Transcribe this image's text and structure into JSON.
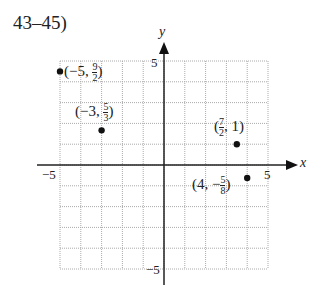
{
  "header": {
    "problem_label": "43–45)"
  },
  "chart_data": {
    "type": "scatter",
    "title": "",
    "xlabel": "x",
    "ylabel": "y",
    "xlim": [
      -5,
      5
    ],
    "ylim": [
      -5,
      5
    ],
    "grid": true,
    "tick_labels": {
      "x": [
        "-5",
        "5"
      ],
      "y": [
        "5",
        "-5"
      ]
    },
    "points": [
      {
        "x": -5,
        "y": 4.5,
        "label": "(−5, 9/2)"
      },
      {
        "x": -3,
        "y": 1.6667,
        "label": "(−3, 5/3)"
      },
      {
        "x": 3.5,
        "y": 1,
        "label": "(7/2, 1)"
      },
      {
        "x": 4,
        "y": -0.625,
        "label": "(4, −5/8)"
      }
    ]
  },
  "axes": {
    "x_label": "x",
    "y_label": "y",
    "x_min_tick": "−5",
    "x_max_tick": "5",
    "y_max_tick": "5",
    "y_min_tick": "−5"
  },
  "point_labels": {
    "p1": {
      "pre": "(−5, ",
      "num": "9",
      "den": "2",
      "post": ")"
    },
    "p2": {
      "pre": "(−3, ",
      "num": "5",
      "den": "3",
      "post": ")"
    },
    "p3": {
      "pre": "(",
      "num": "7",
      "den": "2",
      "post": ", 1)"
    },
    "p4": {
      "pre": "(4, −",
      "num": "5",
      "den": "8",
      "post": ")"
    }
  }
}
